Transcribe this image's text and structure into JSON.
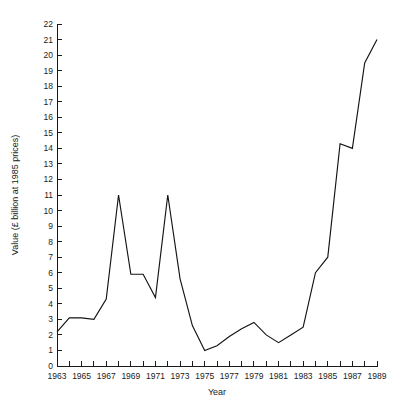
{
  "chart_data": {
    "type": "line",
    "title": "",
    "xlabel": "Year",
    "ylabel": "Value (£ billion at 1985 prices)",
    "xlim": [
      1963,
      1989
    ],
    "ylim": [
      0,
      22
    ],
    "grid": false,
    "legend": null,
    "y_tick_step": 1,
    "x_tick_step": 1,
    "x_label_step": 2,
    "y_ticks": [
      0,
      1,
      2,
      3,
      4,
      5,
      6,
      7,
      8,
      9,
      10,
      11,
      12,
      13,
      14,
      15,
      16,
      17,
      18,
      19,
      20,
      21,
      22
    ],
    "y_tick_labels": [
      "0",
      "1",
      "2",
      "3",
      "4",
      "5",
      "6",
      "7",
      "8",
      "9",
      "10",
      "11",
      "12",
      "13",
      "14",
      "15",
      "16",
      "17",
      "18",
      "19",
      "20",
      "21",
      "22"
    ],
    "x_ticks": [
      1963,
      1964,
      1965,
      1966,
      1967,
      1968,
      1969,
      1970,
      1971,
      1972,
      1973,
      1974,
      1975,
      1976,
      1977,
      1978,
      1979,
      1980,
      1981,
      1982,
      1983,
      1984,
      1985,
      1986,
      1987,
      1988,
      1989
    ],
    "x_tick_labels": [
      "1963",
      "",
      "1965",
      "",
      "1967",
      "",
      "1969",
      "",
      "1971",
      "",
      "1973",
      "",
      "1975",
      "",
      "1977",
      "",
      "1979",
      "",
      "1981",
      "",
      "1983",
      "",
      "1985",
      "",
      "1987",
      "",
      "1989"
    ],
    "series": [
      {
        "name": "Value",
        "color": "#141414",
        "x": [
          1963,
          1964,
          1965,
          1966,
          1967,
          1968,
          1969,
          1970,
          1971,
          1972,
          1973,
          1974,
          1975,
          1976,
          1977,
          1978,
          1979,
          1980,
          1981,
          1982,
          1983,
          1984,
          1985,
          1986,
          1987,
          1988,
          1989
        ],
        "values": [
          2.2,
          3.1,
          3.1,
          3.0,
          4.3,
          11.0,
          5.9,
          5.9,
          4.4,
          11.0,
          5.6,
          2.6,
          1.0,
          1.3,
          1.9,
          2.4,
          2.8,
          2.0,
          1.5,
          2.0,
          2.5,
          6.0,
          7.0,
          14.3,
          14.0,
          19.5,
          21.0
        ]
      }
    ],
    "annotations": []
  },
  "axes": {
    "y_axis_title": "Value (£ billion at 1985 prices)",
    "x_axis_title": "Year"
  }
}
